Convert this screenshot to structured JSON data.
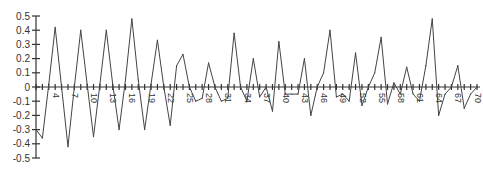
{
  "chart_data": {
    "type": "line",
    "title": "",
    "xlabel": "",
    "ylabel": "",
    "ylim": [
      -0.5,
      0.5
    ],
    "xlim": [
      1,
      70
    ],
    "grid": false,
    "legend": "none",
    "yticks": [
      0.5,
      0.4,
      0.3,
      0.2,
      0.1,
      0,
      -0.1,
      -0.2,
      -0.3,
      -0.4,
      -0.5
    ],
    "ytick_labels": [
      "0.5",
      "0.4",
      "0.3",
      "0.2",
      "0.1",
      "0",
      "-0.1",
      "-0.2",
      "-0.3",
      "-0.4",
      "-0.5"
    ],
    "xtick_labels": [
      "4",
      "7",
      "10",
      "13",
      "16",
      "19",
      "22",
      "25",
      "28",
      "31",
      "34",
      "37",
      "40",
      "43",
      "46",
      "49",
      "52",
      "55",
      "58",
      "61",
      "64",
      "67",
      "70"
    ],
    "xtick_positions": [
      4,
      7,
      10,
      13,
      16,
      19,
      22,
      25,
      28,
      31,
      34,
      37,
      40,
      43,
      46,
      49,
      52,
      55,
      58,
      61,
      64,
      67,
      70
    ],
    "series": [
      {
        "name": "series-1",
        "color": "#444444",
        "x": [
          1,
          2,
          3,
          4,
          5,
          6,
          7,
          8,
          9,
          10,
          11,
          12,
          13,
          14,
          15,
          16,
          17,
          18,
          19,
          20,
          21,
          22,
          23,
          24,
          25,
          26,
          27,
          28,
          29,
          30,
          31,
          32,
          33,
          34,
          35,
          36,
          37,
          38,
          39,
          40,
          41,
          42,
          43,
          44,
          45,
          46,
          47,
          48,
          49,
          50,
          51,
          52,
          53,
          54,
          55,
          56,
          57,
          58,
          59,
          60,
          61,
          62,
          63,
          64,
          65,
          66,
          67,
          68,
          69,
          70
        ],
        "values": [
          -0.3,
          -0.36,
          0.02,
          0.42,
          0.0,
          -0.42,
          0.0,
          0.4,
          0.02,
          -0.35,
          0.02,
          0.4,
          0.02,
          -0.3,
          0.05,
          0.48,
          0.05,
          -0.3,
          0.02,
          0.33,
          0.0,
          -0.27,
          0.15,
          0.23,
          0.0,
          -0.1,
          -0.08,
          0.17,
          0.0,
          -0.1,
          -0.08,
          0.38,
          0.0,
          -0.1,
          0.2,
          -0.07,
          0.0,
          -0.17,
          0.32,
          -0.05,
          -0.05,
          -0.05,
          0.2,
          -0.2,
          0.0,
          0.1,
          0.4,
          -0.07,
          -0.05,
          -0.1,
          0.24,
          -0.13,
          0.0,
          0.1,
          0.35,
          -0.12,
          0.03,
          -0.05,
          0.14,
          -0.05,
          -0.1,
          0.15,
          0.48,
          -0.2,
          -0.05,
          0.0,
          0.15,
          -0.15,
          -0.05,
          0.0
        ]
      }
    ]
  }
}
